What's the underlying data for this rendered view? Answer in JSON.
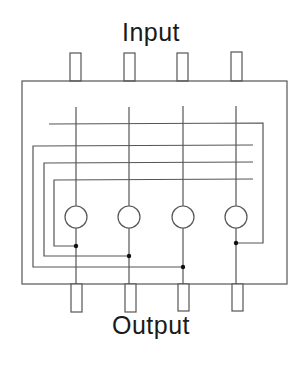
{
  "diagram": {
    "input_label": "Input",
    "output_label": "Output",
    "stroke_color": "#555555",
    "dot_color": "#111111",
    "columns": 4
  }
}
